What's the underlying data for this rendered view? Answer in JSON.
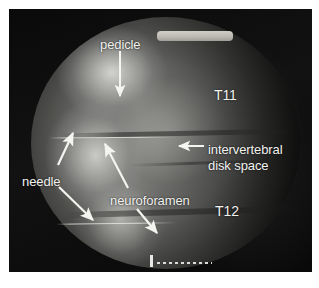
{
  "figure": {
    "modality": "fluoroscopic-radiograph",
    "view": "oblique-thoracic-spine",
    "background_color": "#ffffff",
    "panel_color": "#050505",
    "annotation_color": "#f2f2ef"
  },
  "annotations": {
    "pedicle": {
      "label": "pedicle",
      "arrow": "down-arrow-to-pedicle"
    },
    "vertebra_upper": {
      "label": "T11"
    },
    "vertebra_lower": {
      "label": "T12"
    },
    "intervertebral": {
      "label_line1": "intervertebral",
      "label_line2": "disk space",
      "arrow": "left-arrow-to-disk-space"
    },
    "needle": {
      "label": "needle",
      "arrow_upper": "up-right-arrow-to-upper-needle",
      "arrow_lower": "down-right-arrow-to-lower-needle"
    },
    "neuroforamen": {
      "label": "neuroforamen",
      "arrow_upper": "up-left-arrow-to-upper-neuroforamen",
      "arrow_lower": "down-right-arrow-to-lower-neuroforamen"
    }
  },
  "markers": {
    "collimator_bar": "bright-collimator-bar",
    "scale_marker": "dotted-scale-ruler",
    "needle_upper": "upper-needle-shaft",
    "needle_lower": "lower-needle-shaft"
  }
}
